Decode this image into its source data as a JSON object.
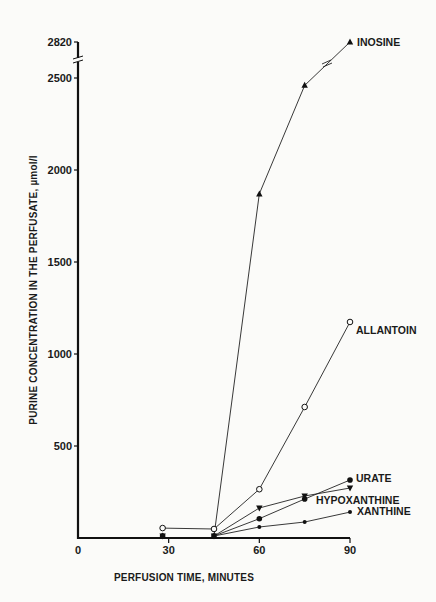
{
  "chart_data": {
    "type": "line",
    "title": "",
    "xlabel": "PERFUSION TIME, MINUTES",
    "ylabel": "PURINE CONCENTRATION IN THE PERFUSATE, µmol/l",
    "xlim": [
      0,
      90
    ],
    "ylim": [
      0,
      2820
    ],
    "x_ticks": [
      0,
      30,
      60,
      90
    ],
    "y_ticks": [
      500,
      1000,
      1500,
      2000,
      2500,
      2820
    ],
    "y_axis_break": "between 2500 and 2820",
    "grid": false,
    "legend_position": "inline labels at line ends",
    "series": [
      {
        "name": "INOSINE",
        "marker": "filled-triangle-up",
        "x": [
          28,
          45,
          60,
          75,
          90
        ],
        "values": [
          5,
          5,
          1870,
          2460,
          2820
        ]
      },
      {
        "name": "ALLANTOIN",
        "marker": "open-circle",
        "x": [
          28,
          45,
          60,
          75,
          90
        ],
        "values": [
          54,
          49,
          265,
          712,
          1174
        ]
      },
      {
        "name": "URATE",
        "marker": "filled-circle",
        "x": [
          28,
          45,
          60,
          75,
          90
        ],
        "values": [
          5,
          5,
          105,
          212,
          315
        ]
      },
      {
        "name": "HYPOXANTHINE",
        "marker": "filled-triangle-down",
        "x": [
          28,
          45,
          60,
          75,
          90
        ],
        "values": [
          5,
          5,
          163,
          228,
          272
        ]
      },
      {
        "name": "XANTHINE",
        "marker": "small-filled-circle",
        "x": [
          28,
          45,
          60,
          75,
          90
        ],
        "values": [
          5,
          5,
          60,
          87,
          141
        ]
      }
    ]
  }
}
